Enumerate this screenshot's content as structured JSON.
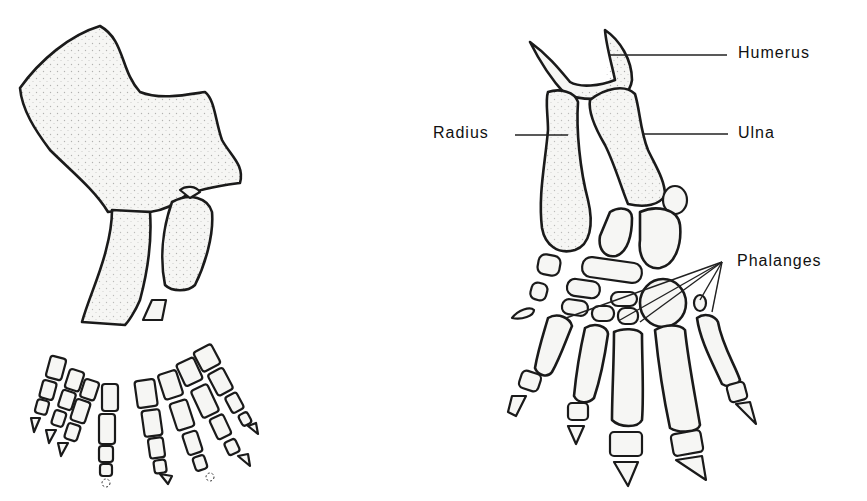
{
  "diagram": {
    "title": "",
    "left_figure": {
      "description": "disarticulated fossil forelimb bones with separated digit rows"
    },
    "right_figure": {
      "description": "articulated forelimb skeleton with labels"
    },
    "labels": {
      "humerus": "Humerus",
      "radius": "Radius",
      "ulna": "Ulna",
      "phalanges": "Phalanges"
    },
    "colors": {
      "ink": "#1a1a1a",
      "bone_fill": "#f6f6f4",
      "background": "#ffffff"
    }
  }
}
